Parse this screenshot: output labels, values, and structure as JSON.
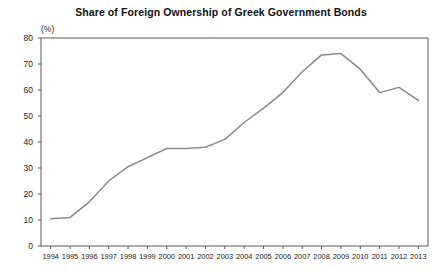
{
  "chart_data": {
    "type": "line",
    "title": "Share of Foreign Ownership of Greek Government Bonds",
    "unit_label": "(%)",
    "xlabel": "",
    "ylabel": "",
    "ylim": [
      0,
      80
    ],
    "yticks": [
      0,
      10,
      20,
      30,
      40,
      50,
      60,
      70,
      80
    ],
    "grid": false,
    "legend": "none",
    "line_color": "#8a8a8a",
    "axis_color": "#5a5a5a",
    "categories": [
      "1994",
      "1995",
      "1996",
      "1997",
      "1998",
      "1999",
      "2000",
      "2001",
      "2002",
      "2003",
      "2004",
      "2005",
      "2006",
      "2007",
      "2008",
      "2009",
      "2010",
      "2011",
      "2012",
      "2013"
    ],
    "values": [
      10.5,
      11.0,
      17.0,
      25.0,
      30.5,
      34.0,
      37.5,
      37.5,
      38.0,
      41.0,
      47.5,
      53.0,
      59.0,
      67.0,
      73.5,
      74.0,
      68.0,
      59.0,
      61.0,
      56.0
    ],
    "series": [
      {
        "name": "Share of foreign ownership",
        "values": [
          10.5,
          11.0,
          17.0,
          25.0,
          30.5,
          34.0,
          37.5,
          37.5,
          38.0,
          41.0,
          47.5,
          53.0,
          59.0,
          67.0,
          73.5,
          74.0,
          68.0,
          59.0,
          61.0,
          56.0
        ]
      }
    ]
  }
}
